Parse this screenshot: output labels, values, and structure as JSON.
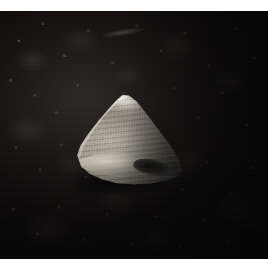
{
  "image": {
    "domain": "Natural-Image",
    "title": "Conical seashell resting on dark volcanic rock",
    "caption": "",
    "width_px": 277,
    "height_px": 273,
    "orientation": "landscape-square",
    "border": {
      "color": "#ffffff",
      "top_px": 11,
      "right_px": 9,
      "bottom_px": 14,
      "left_px": 0
    }
  },
  "scene": {
    "subject_name": "seashell",
    "subject_description": "A single triangular, cone-shaped seashell with a pointed apex at the top and a broad, rounded base, lit from the upper left.",
    "subject_shape": "triangular cone",
    "subject_position": "center",
    "background_name": "dark rocky substrate",
    "background_description": "Very dark, heavily mottled rock or gravel surface flecked with small grey-brown highlights, growing darker toward the right and bottom edges.",
    "lighting": "directional light from upper left",
    "mood": "dark, high-contrast, macro close-up"
  },
  "colors": {
    "background_dark": "#0a0706",
    "background_mid": "#231d1a",
    "background_speckle": "#968878",
    "shell_highlight": "#ece8e0",
    "shell_light": "#b9b3a7",
    "shell_mid": "#8e877c",
    "shell_shadow": "#332f2b",
    "aperture_dark": "#0a0908",
    "border_white": "#ffffff"
  },
  "subject_features": [
    {
      "name": "apex",
      "description": "Bright pointed tip at the top of the cone"
    },
    {
      "name": "growth-bands",
      "description": "Fine horizontal growth bands running across the cone face"
    },
    {
      "name": "vertical-ribbing",
      "description": "Subtle vertical ribs over the shell surface"
    },
    {
      "name": "body-whorl-lip",
      "description": "Bright rounded lip sweeping across the lower body of the shell"
    },
    {
      "name": "aperture",
      "description": "Dark elongated opening in the lower right of the shell"
    },
    {
      "name": "contact-shadow",
      "description": "Soft dark shadow where the shell meets the rock"
    }
  ]
}
